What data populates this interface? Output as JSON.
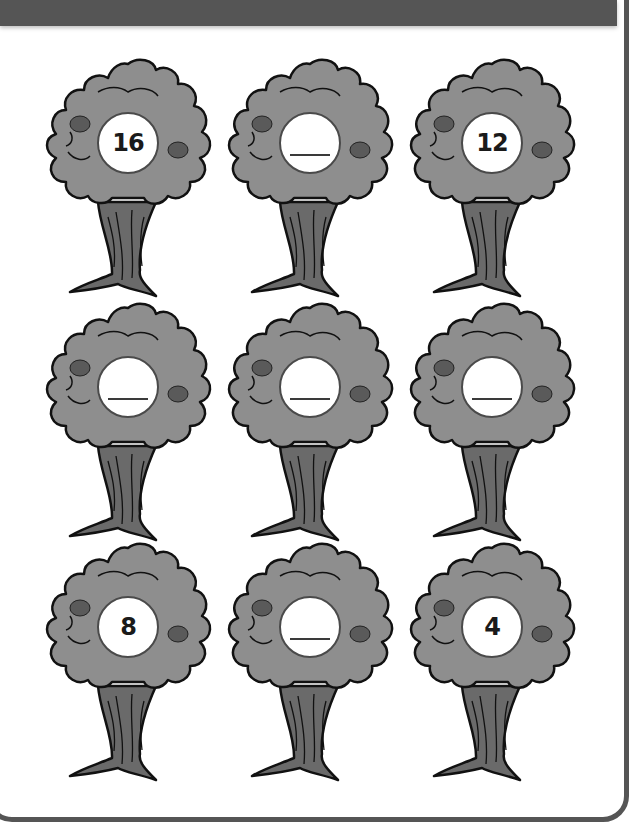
{
  "worksheet": {
    "title": "",
    "rows": [
      [
        {
          "value": "16",
          "blank": false
        },
        {
          "value": "",
          "blank": true
        },
        {
          "value": "12",
          "blank": false
        }
      ],
      [
        {
          "value": "",
          "blank": true
        },
        {
          "value": "",
          "blank": true
        },
        {
          "value": "",
          "blank": true
        }
      ],
      [
        {
          "value": "8",
          "blank": false
        },
        {
          "value": "",
          "blank": true
        },
        {
          "value": "4",
          "blank": false
        }
      ]
    ],
    "colors": {
      "header_bar": "#555555",
      "border": "#555555",
      "foliage": "#8e8e8e",
      "foliage_light": "#a8a8a8",
      "trunk": "#6a6a6a",
      "fruit": "#5a5a5a",
      "outline": "#111111",
      "background": "#ffffff"
    }
  }
}
